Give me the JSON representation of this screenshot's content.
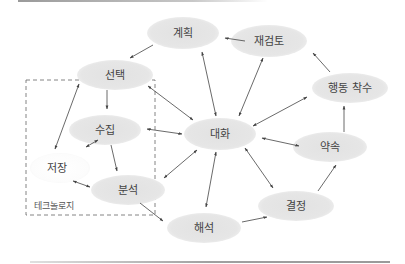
{
  "diagram": {
    "type": "cycle-network",
    "colors": {
      "node_fill": "#e6e6e6",
      "node_fill_light": "#ffffff",
      "edge": "#444444",
      "text": "#444444",
      "group_border": "#777777"
    },
    "group": {
      "label": "테크놀로지",
      "members": [
        "선택",
        "수집",
        "저장",
        "분석"
      ]
    },
    "nodes": [
      {
        "id": "plan",
        "label": "계획"
      },
      {
        "id": "review",
        "label": "재검토"
      },
      {
        "id": "select",
        "label": "선택"
      },
      {
        "id": "action",
        "label": "행동 착수"
      },
      {
        "id": "collect",
        "label": "수집"
      },
      {
        "id": "dialogue",
        "label": "대화"
      },
      {
        "id": "promise",
        "label": "약속"
      },
      {
        "id": "store",
        "label": "저장"
      },
      {
        "id": "analyze",
        "label": "분석"
      },
      {
        "id": "decide",
        "label": "결정"
      },
      {
        "id": "interpret",
        "label": "해석"
      }
    ],
    "edges": [
      {
        "from": "계획",
        "to": "선택",
        "direction": "forward"
      },
      {
        "from": "재검토",
        "to": "계획",
        "direction": "forward"
      },
      {
        "from": "행동 착수",
        "to": "재검토",
        "direction": "forward"
      },
      {
        "from": "약속",
        "to": "행동 착수",
        "direction": "forward"
      },
      {
        "from": "결정",
        "to": "약속",
        "direction": "forward"
      },
      {
        "from": "해석",
        "to": "결정",
        "direction": "forward"
      },
      {
        "from": "분석",
        "to": "해석",
        "direction": "forward"
      },
      {
        "from": "선택",
        "to": "수집",
        "direction": "forward"
      },
      {
        "from": "수집",
        "to": "분석",
        "direction": "forward"
      },
      {
        "from": "저장",
        "to": "선택",
        "direction": "both"
      },
      {
        "from": "수집",
        "to": "저장",
        "direction": "both"
      },
      {
        "from": "저장",
        "to": "분석",
        "direction": "both"
      },
      {
        "from": "대화",
        "to": "계획",
        "direction": "both"
      },
      {
        "from": "대화",
        "to": "재검토",
        "direction": "both"
      },
      {
        "from": "대화",
        "to": "선택",
        "direction": "both"
      },
      {
        "from": "대화",
        "to": "행동 착수",
        "direction": "both"
      },
      {
        "from": "대화",
        "to": "수집",
        "direction": "both"
      },
      {
        "from": "대화",
        "to": "약속",
        "direction": "both"
      },
      {
        "from": "대화",
        "to": "분석",
        "direction": "both"
      },
      {
        "from": "대화",
        "to": "결정",
        "direction": "both"
      },
      {
        "from": "대화",
        "to": "해석",
        "direction": "both"
      }
    ]
  }
}
